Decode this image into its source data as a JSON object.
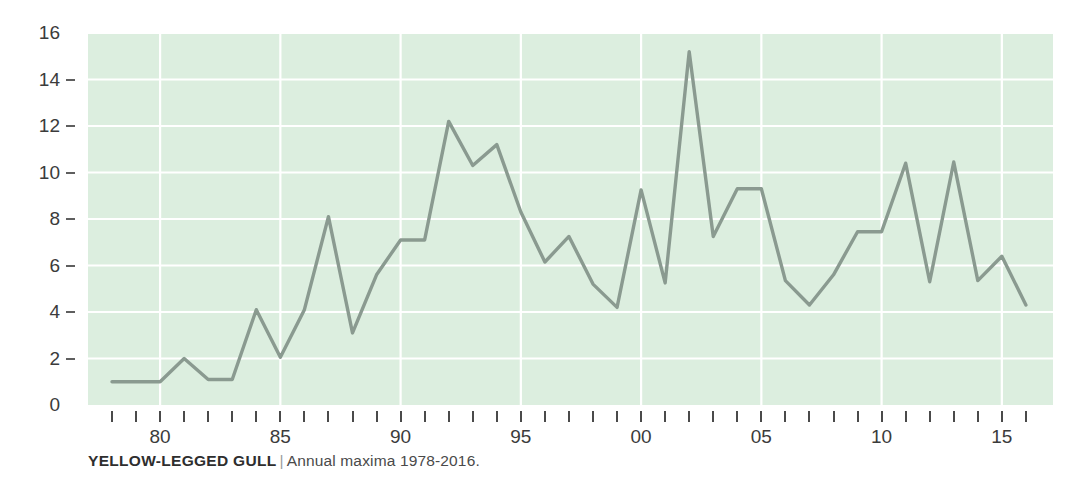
{
  "caption": {
    "title": "YELLOW-LEGGED GULL",
    "separator": "|",
    "subtitle": "Annual maxima 1978-2016."
  },
  "colors": {
    "plot_background": "#dceedf",
    "gridline": "#ffffff",
    "line": "#8a9a90",
    "tick": "#4a4a4a",
    "label_text": "#3b3b3b",
    "page_background": "#ffffff"
  },
  "chart_data": {
    "type": "line",
    "title": "YELLOW-LEGGED GULL",
    "subtitle": "Annual maxima 1978-2016.",
    "xlabel": "",
    "ylabel": "",
    "xlim": [
      1978,
      2016
    ],
    "ylim": [
      0,
      16
    ],
    "grid": true,
    "legend": "none",
    "yticks": [
      0,
      2,
      4,
      6,
      8,
      10,
      12,
      14,
      16
    ],
    "ytick_labels": [
      "0",
      "2",
      "4",
      "6",
      "8",
      "10",
      "12",
      "14",
      "16"
    ],
    "xtick_years": [
      1978,
      1979,
      1980,
      1981,
      1982,
      1983,
      1984,
      1985,
      1986,
      1987,
      1988,
      1989,
      1990,
      1991,
      1992,
      1993,
      1994,
      1995,
      1996,
      1997,
      1998,
      1999,
      2000,
      2001,
      2002,
      2003,
      2004,
      2005,
      2006,
      2007,
      2008,
      2009,
      2010,
      2011,
      2012,
      2013,
      2014,
      2015,
      2016
    ],
    "xtick_labeled": [
      {
        "year": 1980,
        "label": "80"
      },
      {
        "year": 1985,
        "label": "85"
      },
      {
        "year": 1990,
        "label": "90"
      },
      {
        "year": 1995,
        "label": "95"
      },
      {
        "year": 2000,
        "label": "00"
      },
      {
        "year": 2005,
        "label": "05"
      },
      {
        "year": 2010,
        "label": "10"
      },
      {
        "year": 2015,
        "label": "15"
      }
    ],
    "x": [
      1978,
      1979,
      1980,
      1981,
      1982,
      1983,
      1984,
      1985,
      1986,
      1987,
      1988,
      1989,
      1990,
      1991,
      1992,
      1993,
      1994,
      1995,
      1996,
      1997,
      1998,
      1999,
      2000,
      2001,
      2002,
      2003,
      2004,
      2005,
      2006,
      2007,
      2008,
      2009,
      2010,
      2011,
      2012,
      2013,
      2014,
      2015,
      2016
    ],
    "values": [
      1.0,
      1.0,
      1.0,
      2.0,
      1.1,
      1.1,
      4.1,
      2.05,
      4.1,
      8.1,
      3.1,
      5.6,
      7.1,
      7.1,
      12.2,
      10.3,
      11.2,
      8.3,
      6.15,
      7.25,
      5.2,
      4.2,
      9.25,
      5.25,
      15.2,
      7.25,
      9.3,
      9.3,
      5.35,
      4.3,
      5.6,
      7.45,
      7.45,
      10.4,
      5.3,
      10.45,
      5.35,
      6.4,
      4.3
    ],
    "series_name": "Annual maxima"
  }
}
